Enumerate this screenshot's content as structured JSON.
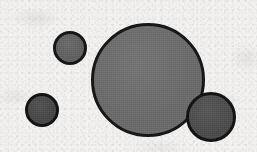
{
  "figure": {
    "width": 257,
    "height": 152,
    "background_color": "#f2f1ef",
    "medium": "scanned line art"
  },
  "chart_data": {
    "type": "scatter",
    "subtitle": "",
    "xlabel": "",
    "ylabel": "",
    "xlim": [
      0,
      257
    ],
    "ylim": [
      0,
      152
    ],
    "grid": false,
    "legend_position": "none",
    "tick_labels_x": [],
    "tick_labels_y": [],
    "annotations": [],
    "marker_shape": "circle",
    "series": [
      {
        "name": "circles",
        "points": [
          {
            "id": "circle-small-upper-left",
            "label": "small upper-left circle",
            "cx": 70,
            "cy": 48,
            "r": 17,
            "diameter": 34,
            "fill_color": "#5f5f5f",
            "stroke_color": "#161616",
            "stroke_width": 3,
            "size_rank": 3
          },
          {
            "id": "circle-small-lower-left",
            "label": "small lower-left circle",
            "cx": 42,
            "cy": 110,
            "r": 17,
            "diameter": 34,
            "fill_color": "#454545",
            "stroke_color": "#131313",
            "stroke_width": 3,
            "size_rank": 4
          },
          {
            "id": "circle-large-center",
            "label": "large central circle",
            "cx": 148,
            "cy": 80,
            "r": 57,
            "diameter": 114,
            "fill_color": "#6a6a6a",
            "stroke_color": "#171717",
            "stroke_width": 3,
            "size_rank": 1
          },
          {
            "id": "circle-medium-lower-right",
            "label": "medium lower-right circle",
            "cx": 211,
            "cy": 117,
            "r": 25,
            "diameter": 50,
            "fill_color": "#4a4a4a",
            "stroke_color": "#141414",
            "stroke_width": 3,
            "size_rank": 2
          }
        ]
      }
    ],
    "counts": {
      "total_circles": 4,
      "light_gray_circles": 2,
      "dark_gray_circles": 2
    }
  }
}
